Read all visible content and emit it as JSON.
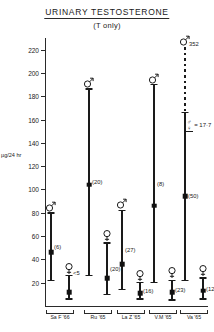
{
  "title": "URINARY  TESTOSTERONE",
  "subtitle": "(T only)",
  "chart_data": {
    "type": "bar",
    "title": "URINARY TESTOSTERONE (T only)",
    "xlabel": "",
    "ylabel": "µg/24 hr",
    "ylim": [
      0,
      230
    ],
    "yticks": [
      20,
      40,
      60,
      80,
      100,
      120,
      140,
      160,
      180,
      200,
      220
    ],
    "grid": false,
    "legend": null,
    "groups": [
      {
        "label": "Sa F '66",
        "series": [
          {
            "sex": "male",
            "symbol": "♂",
            "n": "(6)",
            "low": 22,
            "median": 46,
            "high": 80,
            "top_label": ""
          },
          {
            "sex": "female",
            "symbol": "♀",
            "n": "",
            "low": 6,
            "median": 12,
            "high": 26,
            "top_label": "<5"
          }
        ]
      },
      {
        "label": "Ru '65",
        "series": [
          {
            "sex": "male",
            "symbol": "♂",
            "n": "(20)",
            "low": 26,
            "median": 104,
            "high": 186,
            "top_label": ""
          },
          {
            "sex": "female",
            "symbol": "♀",
            "n": "(20)",
            "low": 10,
            "median": 24,
            "high": 54,
            "top_label": ""
          }
        ]
      },
      {
        "label": "La Z '65",
        "series": [
          {
            "sex": "male",
            "symbol": "♂",
            "n": "(27)",
            "low": 14,
            "median": 36,
            "high": 82,
            "top_label": ""
          },
          {
            "sex": "female",
            "symbol": "♀",
            "n": "(16)",
            "low": 6,
            "median": 11,
            "high": 20,
            "top_label": ""
          }
        ]
      },
      {
        "label": "V.M '65",
        "series": [
          {
            "sex": "male",
            "symbol": "♂",
            "n": "(8)",
            "low": 20,
            "median": 86,
            "high": 190,
            "top_label": ""
          },
          {
            "sex": "female",
            "symbol": "♀",
            "n": "(23)",
            "low": 5,
            "median": 12,
            "high": 22,
            "top_label": ""
          }
        ]
      },
      {
        "label": "Va '65",
        "series": [
          {
            "sex": "male",
            "symbol": "♂",
            "n": "(50)",
            "low": 22,
            "median": 94,
            "high": 166,
            "high_dashed_to": 222,
            "top_label": "352"
          },
          {
            "sex": "female",
            "symbol": "♀",
            "n": "(12)",
            "low": 6,
            "median": 13,
            "high": 24,
            "top_label": ""
          }
        ]
      }
    ],
    "annotations": [
      {
        "name": "sex-ratio",
        "numerator": "♂",
        "denominator": "♀",
        "equals": "= 17·7"
      }
    ]
  }
}
